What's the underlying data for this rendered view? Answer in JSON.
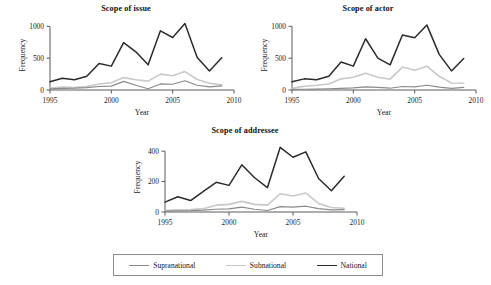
{
  "figure": {
    "background": "#ffffff",
    "series_colors": {
      "Supranational": "#8a8a8a",
      "Subnational": "#c9c9c9",
      "National": "#2b2b2b"
    }
  },
  "legend": {
    "position": "bottom",
    "items": [
      {
        "label": "Supranational",
        "color": "#8a8a8a",
        "width": 1.1
      },
      {
        "label": "Subnational",
        "color": "#c9c9c9",
        "width": 1.6
      },
      {
        "label": "National",
        "color": "#2b2b2b",
        "width": 1.7
      }
    ]
  },
  "chart_data": [
    {
      "id": "issue",
      "type": "line",
      "title": "Scope of issue",
      "xlabel": "Year",
      "ylabel": "Frequency",
      "xlim": [
        1995,
        2010
      ],
      "ylim": [
        0,
        1100
      ],
      "xticks": [
        1995,
        2000,
        2005,
        2010
      ],
      "yticks": [
        0,
        500,
        1000
      ],
      "grid": false,
      "x": [
        1995,
        1996,
        1997,
        1998,
        1999,
        2000,
        2001,
        2002,
        2003,
        2004,
        2005,
        2006,
        2007,
        2008,
        2009
      ],
      "series": [
        {
          "name": "National",
          "values": [
            130,
            185,
            160,
            215,
            415,
            375,
            745,
            600,
            395,
            930,
            825,
            1045,
            510,
            300,
            505
          ]
        },
        {
          "name": "Subnational",
          "values": [
            30,
            45,
            40,
            55,
            95,
            115,
            195,
            160,
            140,
            250,
            225,
            290,
            165,
            105,
            80
          ]
        },
        {
          "name": "Supranational",
          "values": [
            18,
            25,
            28,
            38,
            55,
            60,
            135,
            75,
            20,
            95,
            90,
            145,
            75,
            50,
            65
          ]
        }
      ]
    },
    {
      "id": "actor",
      "type": "line",
      "title": "Scope of actor",
      "xlabel": "Year",
      "ylabel": "Frequency",
      "xlim": [
        1995,
        2010
      ],
      "ylim": [
        0,
        1100
      ],
      "xticks": [
        1995,
        2000,
        2005,
        2010
      ],
      "yticks": [
        0,
        500,
        1000
      ],
      "grid": false,
      "x": [
        1995,
        1996,
        1997,
        1998,
        1999,
        2000,
        2001,
        2002,
        2003,
        2004,
        2005,
        2006,
        2007,
        2008,
        2009
      ],
      "series": [
        {
          "name": "National",
          "values": [
            130,
            175,
            160,
            215,
            440,
            375,
            805,
            500,
            395,
            865,
            820,
            1020,
            560,
            300,
            495
          ]
        },
        {
          "name": "Subnational",
          "values": [
            25,
            60,
            75,
            95,
            175,
            200,
            265,
            200,
            170,
            360,
            310,
            375,
            215,
            110,
            105
          ]
        },
        {
          "name": "Supranational",
          "values": [
            10,
            12,
            15,
            20,
            25,
            32,
            50,
            40,
            28,
            55,
            50,
            75,
            45,
            25,
            40
          ]
        }
      ]
    },
    {
      "id": "addressee",
      "type": "line",
      "title": "Scope of addressee",
      "xlabel": "Year",
      "ylabel": "Frequency",
      "xlim": [
        1995,
        2010
      ],
      "ylim": [
        0,
        460
      ],
      "xticks": [
        1995,
        2000,
        2005,
        2010
      ],
      "yticks": [
        0,
        200,
        400
      ],
      "grid": false,
      "x": [
        1995,
        1996,
        1997,
        1998,
        1999,
        2000,
        2001,
        2002,
        2003,
        2004,
        2005,
        2006,
        2007,
        2008,
        2009
      ],
      "series": [
        {
          "name": "National",
          "values": [
            65,
            100,
            75,
            135,
            195,
            175,
            310,
            225,
            160,
            425,
            360,
            395,
            220,
            140,
            235
          ]
        },
        {
          "name": "Subnational",
          "values": [
            10,
            14,
            16,
            22,
            45,
            50,
            70,
            50,
            45,
            120,
            105,
            125,
            55,
            30,
            25
          ]
        },
        {
          "name": "Supranational",
          "values": [
            6,
            8,
            9,
            12,
            18,
            20,
            32,
            18,
            10,
            35,
            32,
            38,
            22,
            14,
            16
          ]
        }
      ]
    }
  ]
}
